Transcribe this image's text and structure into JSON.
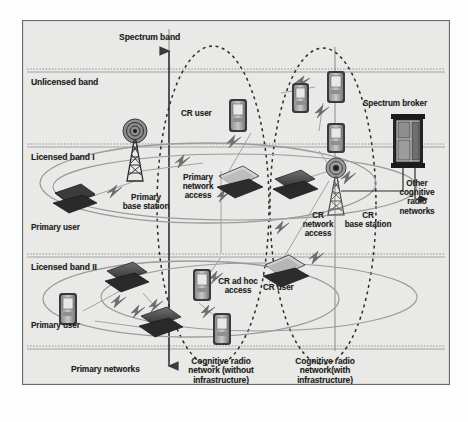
{
  "figure": {
    "background_color": "#e9e9e7",
    "border_color": "#6a6a6a",
    "axis": {
      "title": "Spectrum band",
      "direction": "vertical"
    },
    "bands": [
      {
        "id": "unlicensed",
        "label": "Unlicensed band"
      },
      {
        "id": "licensed-1",
        "label": "Licensed band I"
      },
      {
        "id": "licensed-2",
        "label": "Licensed band II"
      }
    ],
    "groups": [
      {
        "id": "primary-networks",
        "label": "Primary networks"
      },
      {
        "id": "cr-without-infrastructure",
        "label": "Cognitive radio\nnetwork (without\ninfrastructure)"
      },
      {
        "id": "cr-with-infrastructure",
        "label": "Cognitive radio\nnetwork(with\ninfrastructure)"
      }
    ],
    "nodes": [
      {
        "id": "cr-user-top",
        "label": "CR user",
        "type": "pda"
      },
      {
        "id": "primary-base-station",
        "label": "Primary\nbase station",
        "type": "tower"
      },
      {
        "id": "primary-user-1",
        "label": "Primary user",
        "type": "laptop"
      },
      {
        "id": "primary-user-2",
        "label": "Primary user",
        "type": "pda"
      },
      {
        "id": "primary-network-access",
        "label": "Primary\nnetwork\naccess",
        "type": "link"
      },
      {
        "id": "cr-ad-hoc-access",
        "label": "CR ad hoc\naccess",
        "type": "link"
      },
      {
        "id": "cr-user-bottom",
        "label": "CR user",
        "type": "laptop"
      },
      {
        "id": "cr-network-access",
        "label": "CR\nnetwork\naccess",
        "type": "link"
      },
      {
        "id": "cr-base-station",
        "label": "CR\nbase station",
        "type": "tower"
      },
      {
        "id": "spectrum-broker",
        "label": "Spectrum broker",
        "type": "server"
      },
      {
        "id": "other-cr-networks",
        "label": "Other\ncognitive\nradio\nnetworks",
        "type": "arrow-target"
      }
    ],
    "caption": ""
  }
}
